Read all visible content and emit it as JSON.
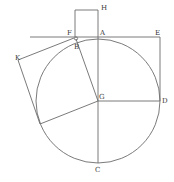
{
  "diagram": {
    "type": "geometric-construction",
    "colors": {
      "line": "#6b6b6b",
      "label": "#3a3a3a",
      "background": "#ffffff"
    },
    "circle": {
      "center": "G",
      "cx": 98,
      "cy": 101,
      "r": 62
    },
    "points": {
      "A": {
        "x": 98,
        "y": 37,
        "label": "A"
      },
      "B": {
        "x": 77,
        "y": 41,
        "label": "B"
      },
      "C": {
        "x": 98,
        "y": 163,
        "label": "C"
      },
      "D": {
        "x": 160,
        "y": 101,
        "label": "D"
      },
      "E": {
        "x": 160,
        "y": 37,
        "label": "E"
      },
      "F": {
        "x": 75,
        "y": 37,
        "label": "F"
      },
      "G": {
        "x": 98,
        "y": 101,
        "label": "G"
      },
      "H": {
        "x": 98,
        "y": 10,
        "label": "H"
      },
      "K": {
        "x": 18,
        "y": 60,
        "label": "K"
      }
    },
    "labels": {
      "A": "A",
      "B": "B",
      "C": "C",
      "D": "D",
      "E": "E",
      "F": "F",
      "G": "G",
      "H": "H",
      "K": "K"
    },
    "segments": [
      [
        "tangent-line",
        30,
        37,
        160,
        37
      ],
      [
        "E-D",
        160,
        37,
        160,
        101
      ],
      [
        "G-D",
        98,
        101,
        160,
        101
      ],
      [
        "H-C",
        98,
        10,
        98,
        163
      ],
      [
        "square-top",
        75,
        10,
        98,
        10
      ],
      [
        "square-left",
        75,
        10,
        75,
        37
      ],
      [
        "B-G",
        76,
        39,
        98,
        101
      ],
      [
        "F-K",
        74,
        38,
        18,
        60
      ],
      [
        "K-corner",
        18,
        60,
        40,
        124
      ],
      [
        "corner-G",
        40,
        124,
        98,
        101
      ]
    ]
  }
}
